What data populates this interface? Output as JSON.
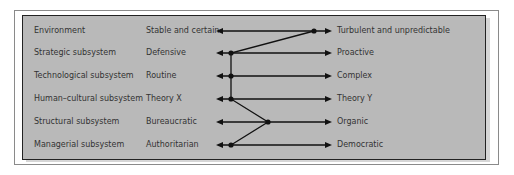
{
  "rows": [
    {
      "subsystem": "Environment",
      "left": "Stable and certain",
      "right": "Turbulent and unpredictable",
      "dot_x": 314
    },
    {
      "subsystem": "Strategic subsystem",
      "left": "Defensive",
      "right": "Proactive",
      "dot_x": 231
    },
    {
      "subsystem": "Technological subsystem",
      "left": "Routine",
      "right": "Complex",
      "dot_x": 231
    },
    {
      "subsystem": "Human–cultural subsystem",
      "left": "Theory X",
      "right": "Theory Y",
      "dot_x": 231
    },
    {
      "subsystem": "Structural subsystem",
      "left": "Bureaucratic",
      "right": "Organic",
      "dot_x": 268
    },
    {
      "subsystem": "Managerial subsystem",
      "left": "Authoritarian",
      "right": "Democratic",
      "dot_x": 231
    }
  ],
  "colors": {
    "panel": "#b9b9b9",
    "line": "#111111",
    "text": "#333333"
  }
}
